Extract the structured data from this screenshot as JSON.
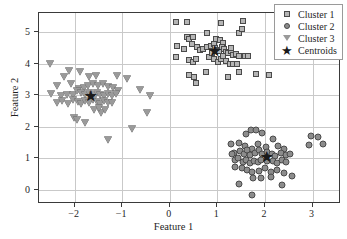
{
  "chart_data": {
    "type": "scatter",
    "title": "",
    "xlabel": "Feature 1",
    "ylabel": "Feature 2",
    "xlim": [
      -2.75,
      3.6
    ],
    "ylim": [
      -0.45,
      5.6
    ],
    "xticks": [
      -2,
      -1,
      0,
      1,
      2,
      3
    ],
    "yticks": [
      0,
      1,
      2,
      3,
      4,
      5
    ],
    "xticklabels": [
      "−2",
      "−1",
      "0",
      "1",
      "2",
      "3"
    ],
    "yticklabels": [
      "0",
      "1",
      "2",
      "3",
      "4",
      "5"
    ],
    "grid": true,
    "legend_position": "upper right",
    "colors": {
      "cluster1_fill": "#b5b5b5",
      "cluster2_fill": "#8c8c8c",
      "cluster3_fill": "#9a9a9a",
      "marker_edge": "#4a4a4a",
      "centroid": "#1a1a1a",
      "grid": "#c9c9c9",
      "axis": "#3a3a3a"
    },
    "series": [
      {
        "name": "Cluster 1",
        "marker": "square",
        "points": [
          [
            0.13,
            5.33
          ],
          [
            0.36,
            5.32
          ],
          [
            1.07,
            5.27
          ],
          [
            1.53,
            5.35
          ],
          [
            0.78,
            4.96
          ],
          [
            1.45,
            4.96
          ],
          [
            1.52,
            5.1
          ],
          [
            0.36,
            4.85
          ],
          [
            0.4,
            4.79
          ],
          [
            0.48,
            4.83
          ],
          [
            0.97,
            4.79
          ],
          [
            1.05,
            4.74
          ],
          [
            1.12,
            4.66
          ],
          [
            0.15,
            4.57
          ],
          [
            0.3,
            4.46
          ],
          [
            0.46,
            4.62
          ],
          [
            0.58,
            4.53
          ],
          [
            0.63,
            4.44
          ],
          [
            0.7,
            4.47
          ],
          [
            0.79,
            4.52
          ],
          [
            0.86,
            4.57
          ],
          [
            0.92,
            4.61
          ],
          [
            0.95,
            4.49
          ],
          [
            1.0,
            4.44
          ],
          [
            1.04,
            4.4
          ],
          [
            1.09,
            4.52
          ],
          [
            1.14,
            4.46
          ],
          [
            1.18,
            4.37
          ],
          [
            1.23,
            4.33
          ],
          [
            1.28,
            4.41
          ],
          [
            1.33,
            4.27
          ],
          [
            1.4,
            4.3
          ],
          [
            1.46,
            4.24
          ],
          [
            1.57,
            4.25
          ],
          [
            1.64,
            4.23
          ],
          [
            0.14,
            4.22
          ],
          [
            0.41,
            4.1
          ],
          [
            0.48,
            4.04
          ],
          [
            0.55,
            4.14
          ],
          [
            0.82,
            4.2
          ],
          [
            0.93,
            4.13
          ],
          [
            1.02,
            4.06
          ],
          [
            1.08,
            4.16
          ],
          [
            1.18,
            4.08
          ],
          [
            1.26,
            4.0
          ],
          [
            1.33,
            3.98
          ],
          [
            1.41,
            4.0
          ],
          [
            0.4,
            3.65
          ],
          [
            0.5,
            3.56
          ],
          [
            0.76,
            3.74
          ],
          [
            1.23,
            3.58
          ],
          [
            1.46,
            3.72
          ],
          [
            0.55,
            3.37
          ],
          [
            1.82,
            3.68
          ],
          [
            2.08,
            3.63
          ],
          [
            1.28,
            4.48
          ],
          [
            0.89,
            4.32
          ],
          [
            1.12,
            4.25
          ]
        ],
        "centroid": [
          0.94,
          4.39
        ]
      },
      {
        "name": "Cluster 2",
        "marker": "circle",
        "points": [
          [
            1.71,
            1.9
          ],
          [
            1.82,
            1.88
          ],
          [
            1.6,
            1.76
          ],
          [
            1.93,
            1.8
          ],
          [
            2.16,
            1.62
          ],
          [
            1.29,
            1.44
          ],
          [
            1.45,
            1.48
          ],
          [
            1.58,
            1.4
          ],
          [
            1.72,
            1.28
          ],
          [
            1.85,
            1.44
          ],
          [
            2.02,
            1.37
          ],
          [
            2.28,
            1.4
          ],
          [
            2.4,
            1.3
          ],
          [
            1.35,
            1.18
          ],
          [
            1.3,
            1.12
          ],
          [
            1.48,
            1.22
          ],
          [
            1.56,
            1.14
          ],
          [
            1.62,
            1.25
          ],
          [
            1.69,
            1.1
          ],
          [
            1.8,
            1.16
          ],
          [
            1.88,
            1.25
          ],
          [
            1.94,
            1.12
          ],
          [
            2.05,
            1.2
          ],
          [
            2.14,
            1.14
          ],
          [
            2.22,
            1.08
          ],
          [
            2.33,
            1.16
          ],
          [
            2.44,
            1.1
          ],
          [
            2.52,
            1.12
          ],
          [
            1.36,
            0.96
          ],
          [
            1.44,
            1.0
          ],
          [
            1.53,
            0.88
          ],
          [
            1.6,
            0.94
          ],
          [
            1.68,
            0.85
          ],
          [
            1.77,
            0.92
          ],
          [
            1.85,
            0.88
          ],
          [
            1.92,
            0.96
          ],
          [
            2.04,
            0.9
          ],
          [
            2.16,
            0.92
          ],
          [
            2.26,
            0.86
          ],
          [
            2.36,
            0.94
          ],
          [
            2.45,
            0.88
          ],
          [
            1.38,
            0.72
          ],
          [
            1.52,
            0.68
          ],
          [
            1.63,
            0.62
          ],
          [
            1.73,
            0.55
          ],
          [
            1.88,
            0.6
          ],
          [
            2.0,
            0.68
          ],
          [
            2.12,
            0.56
          ],
          [
            2.26,
            0.62
          ],
          [
            2.4,
            0.52
          ],
          [
            2.56,
            0.44
          ],
          [
            1.46,
            0.18
          ],
          [
            1.75,
            0.36
          ],
          [
            1.92,
            0.38
          ],
          [
            2.12,
            0.4
          ],
          [
            2.35,
            0.15
          ],
          [
            1.72,
            -0.16
          ],
          [
            2.96,
            1.7
          ],
          [
            3.12,
            1.68
          ],
          [
            2.92,
            1.42
          ],
          [
            3.22,
            1.44
          ]
        ],
        "centroid": [
          2.03,
          1.03
        ]
      },
      {
        "name": "Cluster 3",
        "marker": "triangle_down",
        "points": [
          [
            -2.52,
            3.98
          ],
          [
            -2.12,
            3.78
          ],
          [
            -1.88,
            3.74
          ],
          [
            -2.22,
            3.58
          ],
          [
            -1.7,
            3.56
          ],
          [
            -1.55,
            3.62
          ],
          [
            -1.12,
            3.62
          ],
          [
            -2.38,
            3.28
          ],
          [
            -2.08,
            3.36
          ],
          [
            -1.9,
            3.18
          ],
          [
            -1.8,
            3.22
          ],
          [
            -1.72,
            3.28
          ],
          [
            -1.62,
            3.34
          ],
          [
            -1.5,
            3.3
          ],
          [
            -1.4,
            3.34
          ],
          [
            -1.3,
            3.26
          ],
          [
            -1.2,
            3.22
          ],
          [
            -1.1,
            3.12
          ],
          [
            -0.9,
            3.52
          ],
          [
            -0.62,
            3.16
          ],
          [
            -2.5,
            3.04
          ],
          [
            -2.28,
            2.98
          ],
          [
            -2.16,
            3.0
          ],
          [
            -2.04,
            3.02
          ],
          [
            -1.96,
            3.12
          ],
          [
            -1.86,
            3.06
          ],
          [
            -1.78,
            3.0
          ],
          [
            -1.7,
            3.06
          ],
          [
            -1.62,
            3.0
          ],
          [
            -1.54,
            3.08
          ],
          [
            -1.46,
            3.02
          ],
          [
            -1.38,
            2.96
          ],
          [
            -1.3,
            3.04
          ],
          [
            -1.22,
            2.98
          ],
          [
            -1.14,
            3.04
          ],
          [
            -2.38,
            2.76
          ],
          [
            -2.26,
            2.8
          ],
          [
            -2.14,
            2.72
          ],
          [
            -2.04,
            2.84
          ],
          [
            -1.94,
            2.78
          ],
          [
            -1.86,
            2.72
          ],
          [
            -1.78,
            2.82
          ],
          [
            -1.7,
            2.76
          ],
          [
            -1.62,
            2.86
          ],
          [
            -1.54,
            2.78
          ],
          [
            -1.46,
            2.72
          ],
          [
            -1.38,
            2.8
          ],
          [
            -1.3,
            2.74
          ],
          [
            -1.22,
            2.76
          ],
          [
            -0.42,
            2.96
          ],
          [
            -2.02,
            2.26
          ],
          [
            -1.96,
            2.2
          ],
          [
            -1.78,
            2.12
          ],
          [
            -1.44,
            2.42
          ],
          [
            -0.48,
            2.42
          ],
          [
            -0.8,
            1.94
          ],
          [
            -1.3,
            1.58
          ],
          [
            -1.6,
            2.54
          ],
          [
            -1.48,
            2.6
          ],
          [
            -1.36,
            2.52
          ]
        ],
        "centroid": [
          -1.66,
          2.98
        ]
      }
    ],
    "centroids": {
      "name": "Centroids",
      "marker": "star",
      "points": [
        [
          0.94,
          4.39
        ],
        [
          2.03,
          1.03
        ],
        [
          -1.66,
          2.98
        ]
      ]
    }
  },
  "legend": {
    "items": [
      {
        "label": "Cluster 1",
        "marker": "square"
      },
      {
        "label": "Cluster 2",
        "marker": "circle"
      },
      {
        "label": "Cluster 3",
        "marker": "triangle-down"
      },
      {
        "label": "Centroids",
        "marker": "star"
      }
    ]
  },
  "glyphs": {
    "star": "★"
  }
}
